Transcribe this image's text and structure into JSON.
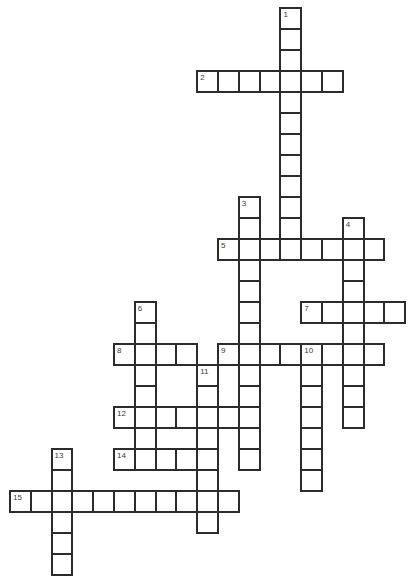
{
  "puzzle": {
    "type": "crossword",
    "grid": {
      "origin_x": 9,
      "origin_y": 7,
      "cell_width": 20.8,
      "cell_height": 21,
      "line_width": 2,
      "border_color": "#2c2c2c",
      "cell_fill": "#ffffff",
      "number_color": "#3a3a3a",
      "background": "#ffffff",
      "columns": 19,
      "rows": 27
    },
    "entries": [
      {
        "number": "1",
        "direction": "down",
        "col": 13,
        "row": 0,
        "length": 12
      },
      {
        "number": "2",
        "direction": "across",
        "col": 9,
        "row": 3,
        "length": 7
      },
      {
        "number": "3",
        "direction": "down",
        "col": 11,
        "row": 9,
        "length": 13
      },
      {
        "number": "4",
        "direction": "down",
        "col": 16,
        "row": 10,
        "length": 10
      },
      {
        "number": "5",
        "direction": "across",
        "col": 10,
        "row": 11,
        "length": 8
      },
      {
        "number": "6",
        "direction": "down",
        "col": 6,
        "row": 14,
        "length": 8
      },
      {
        "number": "7",
        "direction": "across",
        "col": 14,
        "row": 14,
        "length": 5
      },
      {
        "number": "8",
        "direction": "across",
        "col": 5,
        "row": 16,
        "length": 4
      },
      {
        "number": "9",
        "direction": "across",
        "col": 10,
        "row": 16,
        "length": 8
      },
      {
        "number": "10",
        "direction": "down",
        "col": 14,
        "row": 16,
        "length": 7
      },
      {
        "number": "11",
        "direction": "down",
        "col": 9,
        "row": 17,
        "length": 8
      },
      {
        "number": "12",
        "direction": "across",
        "col": 5,
        "row": 19,
        "length": 7
      },
      {
        "number": "13",
        "direction": "down",
        "col": 2,
        "row": 21,
        "length": 6
      },
      {
        "number": "14",
        "direction": "across",
        "col": 5,
        "row": 21,
        "length": 5
      },
      {
        "number": "15",
        "direction": "across",
        "col": 0,
        "row": 23,
        "length": 11
      }
    ]
  }
}
